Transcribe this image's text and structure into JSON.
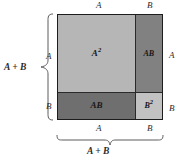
{
  "figure": {
    "identity": "(A + B)^2 = A^2 + 2AB + B^2"
  },
  "colors": {
    "a_squared_fill": "#b6b6b6",
    "ab_right_fill": "#818181",
    "ab_bottom_fill": "#6f6f6f",
    "b_squared_fill": "#c2c2c2",
    "outline": "#1d1d1d",
    "brace": "#5c5c5c",
    "text": "#2b2b2b"
  },
  "regions": {
    "a_squared": {
      "label": "A",
      "exponent": "2"
    },
    "ab_right": {
      "label": "AB"
    },
    "ab_bottom": {
      "label": "AB"
    },
    "b_squared": {
      "label": "B",
      "exponent": "2"
    }
  },
  "labels": {
    "top_a": "A",
    "top_b": "B",
    "left_a": "A",
    "left_b": "B",
    "right_a": "A",
    "right_b": "B",
    "bottom_a": "A",
    "bottom_b": "B",
    "left_sum": "A + B",
    "bottom_sum": "A + B"
  }
}
